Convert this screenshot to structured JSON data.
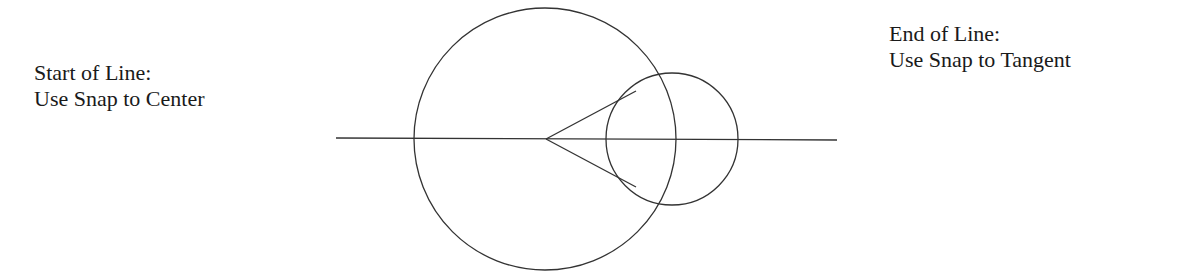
{
  "labels": {
    "start": {
      "title": "Start of Line:",
      "instruction": "Use Snap to Center"
    },
    "end": {
      "title": "End of Line:",
      "instruction": "Use Snap to Tangent"
    }
  },
  "geometry": {
    "stroke_color": "#333333",
    "horizontal_line": {
      "x1": 336,
      "y1": 138,
      "x2": 837,
      "y2": 140
    },
    "large_circle": {
      "cx": 545,
      "cy": 139,
      "r": 131
    },
    "small_circle": {
      "cx": 672,
      "cy": 139,
      "r": 66
    },
    "apex": {
      "x": 546,
      "y": 139
    },
    "tangent_upper": {
      "x": 636,
      "y": 91
    },
    "tangent_lower": {
      "x": 636,
      "y": 187
    }
  }
}
